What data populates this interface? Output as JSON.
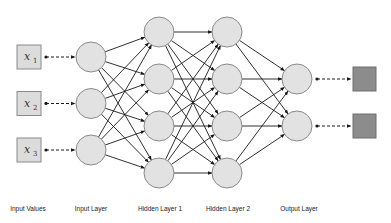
{
  "diagram": {
    "type": "feedforward-neural-network",
    "colors": {
      "node_fill": "#e2e2e2",
      "node_stroke": "#8a8a8a",
      "input_box_fill": "#dcdcdc",
      "input_box_stroke": "#8a8a8a",
      "output_box_fill": "#8c8c8c",
      "output_box_stroke": "#6e6e6e",
      "edge": "#1a1a1a",
      "label": "#222222"
    },
    "inputs": [
      {
        "var": "x",
        "sub": "1"
      },
      {
        "var": "x",
        "sub": "2"
      },
      {
        "var": "x",
        "sub": "3"
      }
    ],
    "layers": [
      {
        "name": "Input Layer",
        "nodes": 3
      },
      {
        "name": "Hidden Layer 1",
        "nodes": 4
      },
      {
        "name": "Hidden Layer 2",
        "nodes": 4
      },
      {
        "name": "Output Layer",
        "nodes": 2
      }
    ],
    "outputs": 2,
    "labels": {
      "input_values": "Input Values",
      "input_layer": "Input Layer",
      "hidden_layer_1": "Hidden Layer 1",
      "hidden_layer_2": "Hidden Layer 2",
      "output_layer": "Output Layer"
    }
  }
}
